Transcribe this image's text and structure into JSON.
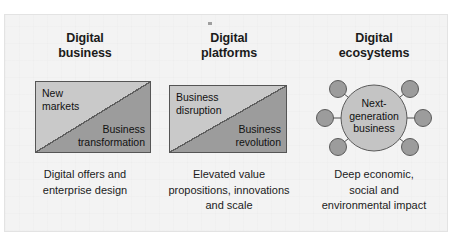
{
  "figure": {
    "background_color": "#f3f3f3",
    "frame_color": "#e3e3e3",
    "box_light_color": "#c9c9c9",
    "box_dark_color": "#9c9c9c",
    "box_border_color": "#555555",
    "node_color": "#9c9c9c",
    "hub_color": "#c4c4c4",
    "text_color": "#1b1b1b"
  },
  "columns": [
    {
      "heading": "Digital\nbusiness",
      "diagram_type": "split-box",
      "upper_label": "New\nmarkets",
      "lower_label": "Business\ntransformation",
      "caption": "Digital offers and\nenterprise design"
    },
    {
      "heading": "Digital\nplatforms",
      "diagram_type": "split-box",
      "upper_label": "Business\ndisruption",
      "lower_label": "Business\nrevolution",
      "caption": "Elevated value\npropositions, innovations\nand scale"
    },
    {
      "heading": "Digital\necosystems",
      "diagram_type": "hub-and-spoke",
      "hub_label": "Next-\ngeneration\nbusiness",
      "satellite_count": 6,
      "caption": "Deep economic,\nsocial and\nenvironmental impact"
    }
  ]
}
